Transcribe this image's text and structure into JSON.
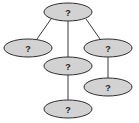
{
  "diagram": {
    "type": "tree",
    "colors": {
      "node_fill": "#d2d2d2",
      "node_stroke": "#2e2e2e",
      "edge": "#3a3a3a"
    },
    "nodes": [
      {
        "id": "root",
        "label": "?",
        "cx": 68,
        "cy": 12,
        "rx": 24,
        "ry": 9
      },
      {
        "id": "left",
        "label": "?",
        "cx": 28,
        "cy": 48,
        "rx": 24,
        "ry": 9
      },
      {
        "id": "middle",
        "label": "?",
        "cx": 68,
        "cy": 66,
        "rx": 24,
        "ry": 9
      },
      {
        "id": "right",
        "label": "?",
        "cx": 108,
        "cy": 48,
        "rx": 24,
        "ry": 9
      },
      {
        "id": "middle-child",
        "label": "?",
        "cx": 68,
        "cy": 109,
        "rx": 24,
        "ry": 9
      },
      {
        "id": "right-child",
        "label": "?",
        "cx": 108,
        "cy": 87,
        "rx": 24,
        "ry": 9
      }
    ],
    "edges": [
      {
        "from": "root",
        "to": "left"
      },
      {
        "from": "root",
        "to": "middle"
      },
      {
        "from": "root",
        "to": "right"
      },
      {
        "from": "middle",
        "to": "middle-child"
      },
      {
        "from": "right",
        "to": "right-child"
      }
    ]
  }
}
